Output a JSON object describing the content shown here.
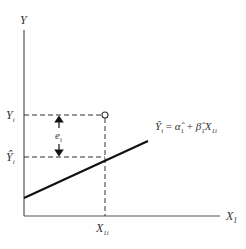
{
  "diagram": {
    "type": "regression-residual-illustration",
    "axes": {
      "y_label": "Y",
      "x_label": "X",
      "x_label_sub": "1"
    },
    "labels": {
      "observed_y": "Y",
      "observed_y_sub": "i",
      "fitted_y": "Ŷ",
      "fitted_y_sub": "i",
      "residual": "e",
      "residual_sub": "i",
      "x_value": "X",
      "x_value_sub": "1i"
    },
    "equation": {
      "lhs": "Ŷ",
      "lhs_sub": "i",
      "eq": " = ",
      "alpha": "α̂",
      "alpha_sub": "1",
      "plus": " + ",
      "beta": "β̂",
      "beta_sub": "1",
      "x": "X",
      "x_sub": "1i"
    },
    "colors": {
      "axis": "#555555",
      "line": "#111111",
      "text": "#333333"
    }
  }
}
